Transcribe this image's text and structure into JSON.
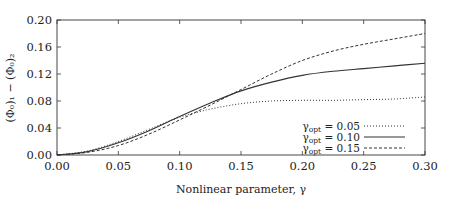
{
  "chart_data": {
    "type": "line",
    "title": "",
    "xlabel": "Nonlinear parameter, γ",
    "ylabel": "(Φ₀)₁ − (Φ₀)₂",
    "xlim": [
      0.0,
      0.3
    ],
    "ylim": [
      0.0,
      0.2
    ],
    "xticks": [
      "0.00",
      "0.05",
      "0.10",
      "0.15",
      "0.20",
      "0.25",
      "0.30"
    ],
    "yticks": [
      "0.00",
      "0.04",
      "0.08",
      "0.12",
      "0.16",
      "0.20"
    ],
    "grid": false,
    "legend_position": "lower right",
    "x": [
      0.0,
      0.025,
      0.05,
      0.075,
      0.1,
      0.125,
      0.15,
      0.175,
      0.2,
      0.225,
      0.25,
      0.275,
      0.3
    ],
    "series": [
      {
        "name": "γopt = 0.05",
        "label_main": "γ",
        "label_sub": "opt",
        "label_value": " = 0.05",
        "style": "dotted",
        "values": [
          0.0,
          0.006,
          0.02,
          0.038,
          0.056,
          0.068,
          0.076,
          0.08,
          0.081,
          0.081,
          0.082,
          0.083,
          0.086
        ]
      },
      {
        "name": "γopt = 0.10",
        "label_main": "γ",
        "label_sub": "opt",
        "label_value": " = 0.10",
        "style": "solid",
        "values": [
          0.0,
          0.005,
          0.018,
          0.036,
          0.057,
          0.077,
          0.095,
          0.108,
          0.118,
          0.124,
          0.128,
          0.132,
          0.136
        ]
      },
      {
        "name": "γopt = 0.15",
        "label_main": "γ",
        "label_sub": "opt",
        "label_value": " = 0.15",
        "style": "dashed",
        "values": [
          0.0,
          0.004,
          0.014,
          0.031,
          0.052,
          0.074,
          0.097,
          0.12,
          0.14,
          0.154,
          0.164,
          0.172,
          0.18
        ]
      }
    ]
  },
  "colors": {
    "axis": "#333333",
    "line": "#333333",
    "background": "#ffffff"
  }
}
